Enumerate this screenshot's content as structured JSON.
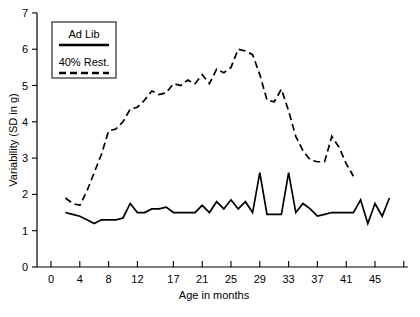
{
  "chart_data": {
    "type": "line",
    "title": "",
    "xlabel": "Age in months",
    "ylabel": "Variability (SD in g)",
    "xlim": [
      -1,
      49
    ],
    "ylim": [
      0,
      7
    ],
    "grid": false,
    "legend_position": "top-left",
    "xticks": [
      0,
      4,
      8,
      12,
      17,
      21,
      25,
      29,
      33,
      37,
      41,
      45
    ],
    "xtick_labels": [
      "0",
      "4",
      "8",
      "12",
      "17",
      "21",
      "25",
      "29",
      "33",
      "37",
      "41",
      "45"
    ],
    "extra_unlabeled_xticks": [
      49
    ],
    "yticks": [
      0,
      1,
      2,
      3,
      4,
      5,
      6,
      7
    ],
    "ytick_labels": [
      "0",
      "1",
      "2",
      "3",
      "4",
      "5",
      "6",
      "7"
    ],
    "series": [
      {
        "name": "Ad Lib",
        "style": "solid",
        "color": "#000000",
        "x": [
          2,
          3,
          4,
          5,
          6,
          7,
          8,
          9,
          10,
          11,
          12,
          13,
          14,
          15,
          16,
          17,
          18,
          19,
          20,
          21,
          22,
          23,
          24,
          25,
          26,
          27,
          28,
          29,
          30,
          31,
          32,
          33,
          34,
          35,
          36,
          37,
          38,
          39,
          40,
          41,
          42,
          43,
          44,
          45,
          46,
          47
        ],
        "values": [
          1.5,
          1.45,
          1.4,
          1.3,
          1.2,
          1.3,
          1.3,
          1.3,
          1.35,
          1.75,
          1.5,
          1.5,
          1.6,
          1.6,
          1.65,
          1.5,
          1.5,
          1.5,
          1.5,
          1.7,
          1.5,
          1.8,
          1.6,
          1.85,
          1.6,
          1.8,
          1.5,
          2.6,
          1.45,
          1.45,
          1.45,
          2.6,
          1.5,
          1.75,
          1.6,
          1.4,
          1.45,
          1.5,
          1.5,
          1.5,
          1.5,
          1.85,
          1.2,
          1.75,
          1.4,
          1.9
        ]
      },
      {
        "name": "40% Rest.",
        "style": "dashed",
        "color": "#000000",
        "x": [
          2,
          3,
          4,
          5,
          6,
          7,
          8,
          9,
          10,
          11,
          12,
          13,
          14,
          15,
          16,
          17,
          18,
          19,
          20,
          21,
          22,
          23,
          24,
          25,
          26,
          27,
          28,
          29,
          30,
          31,
          32,
          33,
          34,
          35,
          36,
          37,
          38,
          39,
          40,
          41,
          42
        ],
        "values": [
          1.9,
          1.75,
          1.7,
          2.1,
          2.6,
          3.1,
          3.75,
          3.8,
          4.0,
          4.35,
          4.4,
          4.6,
          4.85,
          4.75,
          4.8,
          5.05,
          5.0,
          5.15,
          5.05,
          5.3,
          5.05,
          5.45,
          5.35,
          5.5,
          6.0,
          5.95,
          5.85,
          5.3,
          4.6,
          4.55,
          4.9,
          4.3,
          3.6,
          3.2,
          2.95,
          2.9,
          2.9,
          3.6,
          3.3,
          2.85,
          2.5
        ]
      }
    ]
  },
  "legend": {
    "entries": [
      {
        "label": "Ad Lib",
        "style": "solid"
      },
      {
        "label": "40% Rest.",
        "style": "dashed"
      }
    ]
  }
}
